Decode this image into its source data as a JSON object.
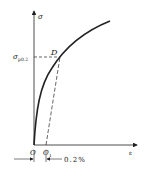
{
  "diagram": {
    "axis_y_label": "σ",
    "axis_x_label": "ε",
    "yield_label_main": "σ",
    "yield_label_sub": "p0.2",
    "point_label": "D",
    "origin_label": "O",
    "offset_origin_label_main": "O",
    "offset_origin_label_sub": "1",
    "offset_dimension_label": "0.2%",
    "colors": {
      "line": "#222222",
      "background": "#ffffff"
    }
  }
}
